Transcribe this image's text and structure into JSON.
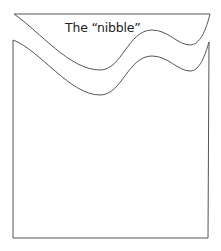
{
  "diagram": {
    "label": "The “nibble”",
    "cut_text": "l        ibbl f",
    "stroke_color": "#555555",
    "background": "#ffffff",
    "shapes": [
      {
        "name": "nibble-piece",
        "description": "Thin strip cut from top with wavy bottom edge"
      },
      {
        "name": "main-body",
        "description": "Rectangle with wavy top edge matching nibble"
      }
    ]
  }
}
